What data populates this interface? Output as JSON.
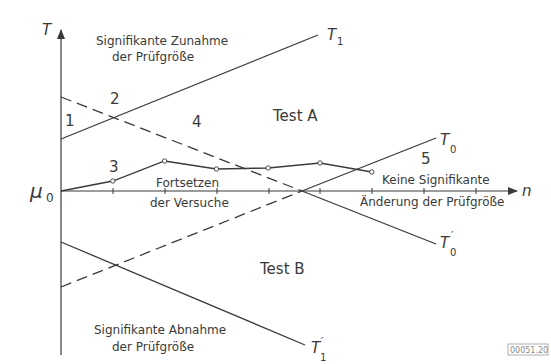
{
  "axes": {
    "y_label": "T",
    "x_label": "n",
    "origin_label": "μ",
    "origin_sub": "0"
  },
  "lines": {
    "t1": {
      "label": "T",
      "sub": "1",
      "prime": ""
    },
    "t0": {
      "label": "T",
      "sub": "0",
      "prime": ""
    },
    "t0p": {
      "label": "T",
      "sub": "0",
      "prime": "′"
    },
    "t1p": {
      "label": "T",
      "sub": "1",
      "prime": "′"
    }
  },
  "regions": {
    "r1": "1",
    "r2": "2",
    "r3": "3",
    "r4": "4",
    "r5": "5"
  },
  "texts": {
    "increase_line1": "Signifikante Zunahme",
    "increase_line2": "der Prüfgröße",
    "test_a": "Test A",
    "test_b": "Test B",
    "continue_line1": "Fortsetzen",
    "continue_line2": "der Versuche",
    "nochange_line1": "Keine Signifikante",
    "nochange_line2": "Änderung der Prüfgröße",
    "decrease_line1": "Signifikante Abnahme",
    "decrease_line2": "der Prüfgröße",
    "figure_id": "00051.20"
  },
  "sample_path": {
    "steps": [
      0,
      1,
      2,
      3,
      4,
      5,
      6
    ],
    "values": [
      0,
      0.1,
      0.3,
      0.22,
      0.23,
      0.28,
      0.19
    ]
  },
  "colors": {
    "ink": "#3a3a3a"
  }
}
